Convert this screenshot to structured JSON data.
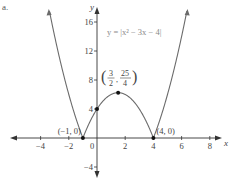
{
  "figure": {
    "part_label": "a.",
    "equation_label": "y = |x² − 3x − 4|",
    "colors": {
      "curve": "#6b6b6b",
      "axis": "#333333",
      "text": "#444444",
      "equation_text": "#8a8a8a",
      "point": "#111111"
    }
  },
  "chart_data": {
    "type": "line",
    "title": "",
    "function": "y = |x^2 - 3x - 4|",
    "xlabel": "x",
    "ylabel": "y",
    "xlim": [
      -6,
      8.6
    ],
    "ylim": [
      -5.3,
      17
    ],
    "x_ticks": [
      -4,
      -2,
      0,
      2,
      4,
      6,
      8
    ],
    "x_tick_labels": [
      "−4",
      "−2",
      "0",
      "2",
      "4",
      "6",
      "8"
    ],
    "y_ticks": [
      -4,
      4,
      8,
      12,
      16
    ],
    "y_tick_labels": [
      "−4",
      "4",
      "8",
      "12",
      "16"
    ],
    "grid": false,
    "legend": null,
    "series": [
      {
        "name": "y = |x^2 - 3x - 4|",
        "x": [
          -3.5,
          -3,
          -2.5,
          -2,
          -1.5,
          -1,
          -0.5,
          0,
          0.5,
          1,
          1.5,
          2,
          2.5,
          3,
          3.5,
          4,
          4.5,
          5,
          5.5,
          6,
          6.5
        ],
        "values": [
          18.75,
          14,
          9.75,
          6,
          2.75,
          0,
          2.25,
          4,
          5.25,
          6,
          6.25,
          6,
          5.25,
          4,
          2.25,
          0,
          2.75,
          6,
          9.75,
          14,
          18.75
        ]
      }
    ],
    "marked_points": [
      {
        "x": -1,
        "y": 0,
        "label": "(−1, 0)"
      },
      {
        "x": 0,
        "y": 4,
        "label": ""
      },
      {
        "x": 1.5,
        "y": 6.25,
        "label": "(3/2, 25/4)"
      },
      {
        "x": 4,
        "y": 0,
        "label": "(4, 0)"
      }
    ],
    "annotations": [
      {
        "text": "y = |x² − 3x − 4|",
        "position": "upper right of y-axis"
      },
      {
        "text": "(3/2, 25/4)",
        "position": "above vertex"
      },
      {
        "text": "(−1, 0)",
        "position": "left x-intercept"
      },
      {
        "text": "(4, 0)",
        "position": "right x-intercept"
      }
    ]
  }
}
